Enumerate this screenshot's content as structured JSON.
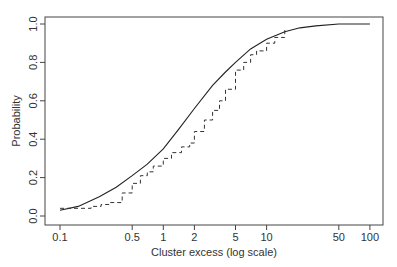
{
  "chart_data": {
    "type": "line",
    "title": "",
    "xlabel": "Cluster excess (log scale)",
    "ylabel": "Probability",
    "xscale": "log",
    "xlim": [
      0.085,
      130
    ],
    "ylim": [
      -0.04,
      1.04
    ],
    "x_ticks": [
      0.1,
      0.5,
      1,
      2,
      5,
      10,
      50,
      100
    ],
    "x_tick_labels": [
      "0.1",
      "0.5",
      "1",
      "2",
      "5",
      "10",
      "50",
      "100"
    ],
    "y_ticks": [
      0.0,
      0.2,
      0.4,
      0.6,
      0.8,
      1.0
    ],
    "y_tick_labels": [
      "0.0",
      "0.2",
      "0.4",
      "0.6",
      "0.8",
      "1.0"
    ],
    "grid": false,
    "legend": null,
    "series": [
      {
        "name": "fitted",
        "style": "solid",
        "x": [
          0.1,
          0.15,
          0.24,
          0.35,
          0.5,
          0.7,
          1,
          1.4,
          2,
          3,
          4,
          5,
          7,
          10,
          15,
          21,
          30,
          50,
          100
        ],
        "y": [
          0.03,
          0.05,
          0.1,
          0.15,
          0.21,
          0.27,
          0.35,
          0.45,
          0.56,
          0.68,
          0.75,
          0.8,
          0.87,
          0.92,
          0.96,
          0.98,
          0.99,
          1.0,
          1.0
        ]
      },
      {
        "name": "empirical",
        "style": "dashed-step",
        "x": [
          0.1,
          0.15,
          0.2,
          0.25,
          0.3,
          0.4,
          0.5,
          0.6,
          0.7,
          0.8,
          1,
          1.2,
          1.5,
          1.8,
          2,
          2.5,
          3,
          3.5,
          4,
          5,
          6,
          7,
          8,
          10,
          12,
          15
        ],
        "y": [
          0.04,
          0.04,
          0.05,
          0.06,
          0.07,
          0.12,
          0.17,
          0.21,
          0.23,
          0.26,
          0.3,
          0.33,
          0.36,
          0.38,
          0.44,
          0.5,
          0.55,
          0.6,
          0.66,
          0.76,
          0.8,
          0.84,
          0.86,
          0.9,
          0.93,
          0.97
        ]
      }
    ]
  }
}
